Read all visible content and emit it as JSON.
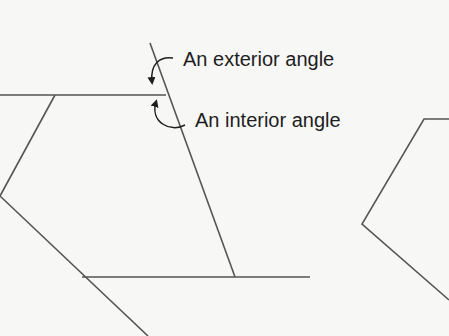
{
  "diagram": {
    "labels": {
      "exterior": "An exterior angle",
      "interior": "An interior angle"
    },
    "colors": {
      "background": "#f7f7f6",
      "line": "#555555",
      "text": "#1e1e1e",
      "arrow": "#1e1e1e"
    },
    "shapes": [
      {
        "name": "left-polygon-with-extended-side",
        "description": "Polygon with one side extended to show exterior angle"
      },
      {
        "name": "right-polygon-partial",
        "description": "Partially visible polygon at right edge"
      }
    ]
  }
}
